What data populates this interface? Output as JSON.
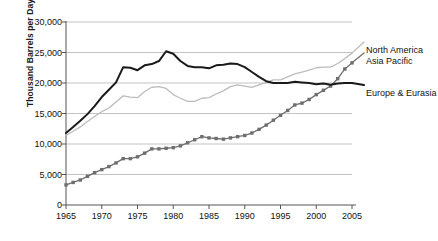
{
  "chart_data": {
    "type": "line",
    "title": "",
    "xlabel": "",
    "ylabel": "Thousand Barrels per Day",
    "xlim": [
      1965,
      2005
    ],
    "ylim": [
      0,
      30000
    ],
    "ytick_labels": [
      "0",
      "5,000",
      "10,000",
      "15,000",
      "20,000",
      "25,000",
      "30,000"
    ],
    "ytick_values": [
      0,
      5000,
      10000,
      15000,
      20000,
      25000,
      30000
    ],
    "xtick_labels": [
      "1965",
      "1970",
      "1975",
      "1980",
      "1985",
      "1990",
      "1995",
      "2000",
      "2005"
    ],
    "xtick_values": [
      1965,
      1970,
      1975,
      1980,
      1985,
      1990,
      1995,
      2000,
      2005
    ],
    "grid": true,
    "legend_position": "right-inline",
    "x": [
      1965,
      1966,
      1967,
      1968,
      1969,
      1970,
      1971,
      1972,
      1973,
      1974,
      1975,
      1976,
      1977,
      1978,
      1979,
      1980,
      1981,
      1982,
      1983,
      1984,
      1985,
      1986,
      1987,
      1988,
      1989,
      1990,
      1991,
      1992,
      1993,
      1994,
      1995,
      1996,
      1997,
      1998,
      1999,
      2000,
      2001,
      2002,
      2003,
      2004,
      2005
    ],
    "series": [
      {
        "name": "North America",
        "color": "#bcbcbc",
        "marker": "none",
        "width": 1.3,
        "values": [
          11400,
          12100,
          12800,
          13700,
          14500,
          15300,
          15900,
          16900,
          17900,
          17700,
          17600,
          18600,
          19300,
          19400,
          19100,
          18100,
          17500,
          17000,
          17000,
          17500,
          17600,
          18200,
          18700,
          19400,
          19700,
          19500,
          19300,
          19700,
          20100,
          20500,
          20500,
          21000,
          21500,
          21800,
          22100,
          22500,
          22600,
          22600,
          23200,
          24000,
          24900
        ]
      },
      {
        "name": "Asia Pacific",
        "color": "#6e6e6e",
        "marker": "square",
        "width": 1.3,
        "values": [
          3300,
          3700,
          4100,
          4700,
          5300,
          5800,
          6300,
          6900,
          7600,
          7600,
          7900,
          8500,
          9200,
          9200,
          9300,
          9400,
          9700,
          10200,
          10700,
          11200,
          11000,
          10900,
          10800,
          11000,
          11200,
          11400,
          11800,
          12400,
          13100,
          13900,
          14700,
          15500,
          16400,
          16700,
          17300,
          18100,
          18800,
          19500,
          20700,
          22300,
          23300
        ]
      },
      {
        "name": "Europe & Eurasia",
        "color": "#1a1a1a",
        "marker": "none",
        "width": 2.0,
        "values": [
          11800,
          12800,
          13800,
          14900,
          16200,
          17700,
          18900,
          20100,
          22600,
          22500,
          22100,
          22900,
          23100,
          23600,
          25200,
          24800,
          23600,
          22800,
          22600,
          22600,
          22400,
          22900,
          23000,
          23200,
          23100,
          22600,
          21800,
          21000,
          20300,
          20000,
          20000,
          20000,
          20200,
          20100,
          20000,
          19800,
          19900,
          19700,
          19900,
          20000,
          20000
        ]
      }
    ],
    "series_labels": [
      {
        "name": "North America",
        "x": 366,
        "y": 45
      },
      {
        "name": "Asia Pacific",
        "x": 366,
        "y": 56
      },
      {
        "name": "Europe & Eurasia",
        "x": 366,
        "y": 88
      }
    ]
  }
}
